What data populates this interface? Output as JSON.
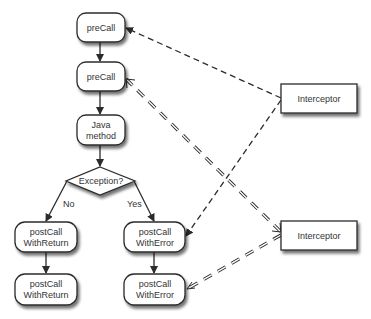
{
  "diagram": {
    "type": "flowchart",
    "nodes": {
      "precall_1": {
        "label": "preCall"
      },
      "precall_2": {
        "label": "preCall"
      },
      "java_method": {
        "line1": "Java",
        "line2": "method"
      },
      "exception_decision": {
        "label": "Exception?"
      },
      "postcall_return_1": {
        "line1": "postCall",
        "line2": "WithReturn"
      },
      "postcall_return_2": {
        "line1": "postCall",
        "line2": "WithReturn"
      },
      "postcall_error_1": {
        "line1": "postCall",
        "line2": "WithError"
      },
      "postcall_error_2": {
        "line1": "postCall",
        "line2": "WithError"
      },
      "interceptor_1": {
        "label": "Interceptor"
      },
      "interceptor_2": {
        "label": "Interceptor"
      }
    },
    "edge_labels": {
      "no": "No",
      "yes": "Yes"
    },
    "colors": {
      "stroke": "#2b2b2b",
      "fill": "#ffffff",
      "text": "#333333"
    }
  }
}
